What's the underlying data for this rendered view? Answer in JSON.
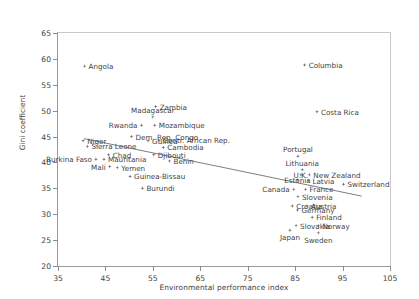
{
  "chart_data": {
    "type": "scatter",
    "title": "",
    "xlabel": "Environmental performance index",
    "ylabel": "Gini coefficient",
    "xlim": [
      35,
      105
    ],
    "ylim": [
      20,
      65
    ],
    "xticks": [
      35,
      45,
      55,
      65,
      75,
      85,
      95,
      105
    ],
    "yticks": [
      20,
      25,
      30,
      35,
      40,
      45,
      50,
      55,
      60,
      65
    ],
    "grid": false,
    "legend": "none",
    "marker_color": "#6e6e6e",
    "trendline": {
      "x0": 40.5,
      "y0": 44.6,
      "x1": 99.0,
      "y1": 33.5,
      "color": "#5d5d5d"
    },
    "points": [
      {
        "label": "Angola",
        "x": 40.6,
        "y": 58.6,
        "lpos": "right"
      },
      {
        "label": "Zambia",
        "x": 55.6,
        "y": 50.8,
        "lpos": "right"
      },
      {
        "label": "Madagascar",
        "x": 55.0,
        "y": 48.8,
        "lpos": "center-above"
      },
      {
        "label": "Mozambique",
        "x": 55.4,
        "y": 47.2,
        "lpos": "right"
      },
      {
        "label": "Rwanda",
        "x": 52.6,
        "y": 47.2,
        "lpos": "left"
      },
      {
        "label": "Dem. Rep. Congo",
        "x": 50.5,
        "y": 45.0,
        "lpos": "right"
      },
      {
        "label": "Centr. African Rep.",
        "x": 56.3,
        "y": 44.3,
        "lpos": "right"
      },
      {
        "label": "Guinea",
        "x": 54.0,
        "y": 44.2,
        "lpos": "right"
      },
      {
        "label": "Niger",
        "x": 40.3,
        "y": 44.2,
        "lpos": "right"
      },
      {
        "label": "Sierra Leone",
        "x": 41.2,
        "y": 43.1,
        "lpos": "right"
      },
      {
        "label": "Cambodia",
        "x": 57.2,
        "y": 42.9,
        "lpos": "right"
      },
      {
        "label": "Djibouti",
        "x": 55.2,
        "y": 41.5,
        "lpos": "right"
      },
      {
        "label": "Chad",
        "x": 45.7,
        "y": 41.5,
        "lpos": "right"
      },
      {
        "label": "Burkina Faso",
        "x": 43.0,
        "y": 40.6,
        "lpos": "left"
      },
      {
        "label": "Mauritania",
        "x": 44.7,
        "y": 40.6,
        "lpos": "right"
      },
      {
        "label": "Benin",
        "x": 58.5,
        "y": 40.3,
        "lpos": "right"
      },
      {
        "label": "Mali",
        "x": 45.9,
        "y": 39.2,
        "lpos": "left"
      },
      {
        "label": "Yemen",
        "x": 47.5,
        "y": 39.0,
        "lpos": "right"
      },
      {
        "label": "Guinea-Bissau",
        "x": 50.2,
        "y": 37.3,
        "lpos": "right"
      },
      {
        "label": "Burundi",
        "x": 52.8,
        "y": 35.0,
        "lpos": "right"
      },
      {
        "label": "Columbia",
        "x": 87.0,
        "y": 58.8,
        "lpos": "right"
      },
      {
        "label": "Costa Rica",
        "x": 89.6,
        "y": 49.8,
        "lpos": "right"
      },
      {
        "label": "Portugal",
        "x": 85.6,
        "y": 41.2,
        "lpos": "center-above"
      },
      {
        "label": "Lithuania",
        "x": 86.5,
        "y": 38.6,
        "lpos": "center-above"
      },
      {
        "label": "New Zealand",
        "x": 88.0,
        "y": 37.6,
        "lpos": "right"
      },
      {
        "label": "U.K.",
        "x": 86.2,
        "y": 37.6,
        "lpos": "center"
      },
      {
        "label": "Estonia",
        "x": 85.5,
        "y": 36.6,
        "lpos": "center"
      },
      {
        "label": "Latvia",
        "x": 87.8,
        "y": 36.5,
        "lpos": "right"
      },
      {
        "label": "Switzerland",
        "x": 95.2,
        "y": 35.8,
        "lpos": "right"
      },
      {
        "label": "Canada",
        "x": 84.7,
        "y": 34.8,
        "lpos": "left"
      },
      {
        "label": "France",
        "x": 87.2,
        "y": 34.8,
        "lpos": "right"
      },
      {
        "label": "Slovenia",
        "x": 85.6,
        "y": 33.4,
        "lpos": "right"
      },
      {
        "label": "Croatia",
        "x": 84.4,
        "y": 31.6,
        "lpos": "right"
      },
      {
        "label": "Austria",
        "x": 87.5,
        "y": 31.6,
        "lpos": "right"
      },
      {
        "label": "Germany",
        "x": 85.5,
        "y": 30.8,
        "lpos": "right"
      },
      {
        "label": "Finland",
        "x": 88.6,
        "y": 29.4,
        "lpos": "right"
      },
      {
        "label": "Slovakia",
        "x": 85.2,
        "y": 27.8,
        "lpos": "right"
      },
      {
        "label": "Norway",
        "x": 89.9,
        "y": 27.8,
        "lpos": "right"
      },
      {
        "label": "Sweden",
        "x": 89.9,
        "y": 26.4,
        "lpos": "center-below"
      },
      {
        "label": "Japan",
        "x": 83.9,
        "y": 26.9,
        "lpos": "center-below"
      }
    ]
  }
}
